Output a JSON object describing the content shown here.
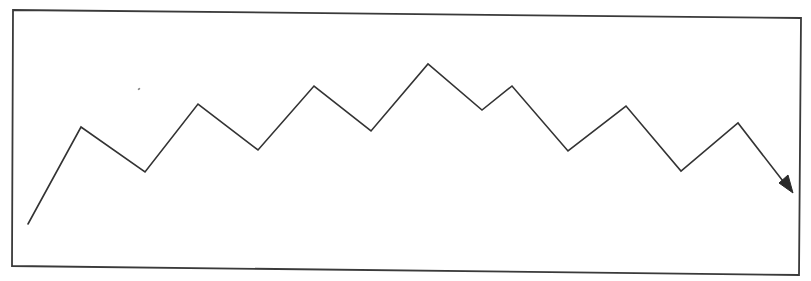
{
  "diagram": {
    "type": "zigzag-trend-line",
    "colors": {
      "background": "#ffffff",
      "frame": "#3a3a3a",
      "line": "#333333",
      "arrowhead": "#2a2a2a",
      "speck": "#8a8a8a"
    },
    "frame": {
      "points": [
        [
          13,
          10
        ],
        [
          801,
          18
        ],
        [
          799,
          275
        ],
        [
          12,
          266
        ]
      ]
    },
    "polyline": {
      "points": [
        [
          28,
          224
        ],
        [
          81,
          127
        ],
        [
          145,
          172
        ],
        [
          198,
          104
        ],
        [
          258,
          150
        ],
        [
          314,
          86
        ],
        [
          371,
          131
        ],
        [
          428,
          64
        ],
        [
          482,
          110
        ],
        [
          512,
          86
        ],
        [
          568,
          151
        ],
        [
          626,
          106
        ],
        [
          681,
          171
        ],
        [
          738,
          123
        ],
        [
          786,
          185
        ]
      ],
      "stroke_width": 1.6
    },
    "arrowhead": {
      "tip": [
        793,
        193
      ],
      "points": [
        [
          793,
          193
        ],
        [
          779,
          183
        ],
        [
          788,
          175
        ]
      ]
    },
    "speck": {
      "x": 139,
      "y": 89
    }
  }
}
